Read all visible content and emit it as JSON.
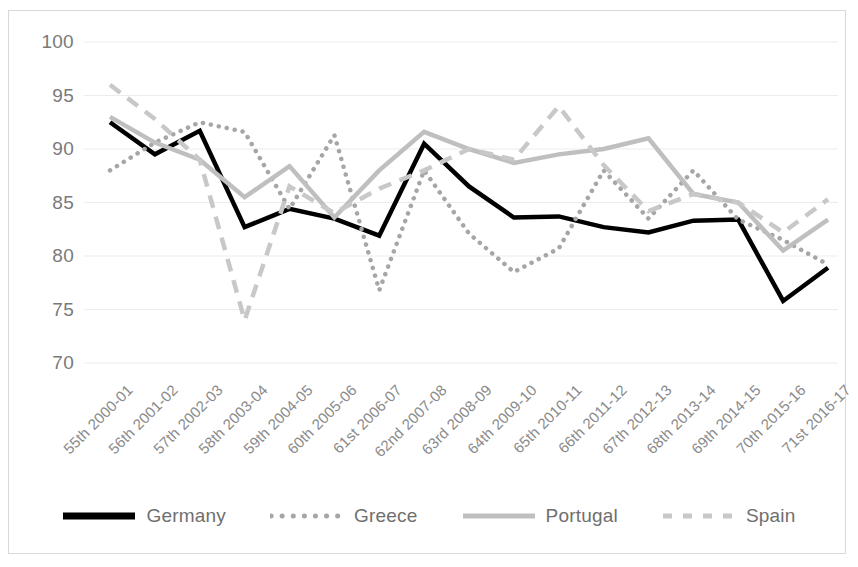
{
  "chart_data": {
    "type": "line",
    "title": "",
    "xlabel": "",
    "ylabel": "",
    "ylim": [
      70,
      100
    ],
    "yticks": [
      70,
      75,
      80,
      85,
      90,
      95,
      100
    ],
    "grid": true,
    "legend_position": "bottom",
    "categories": [
      "55th 2000-01",
      "56th 2001-02",
      "57th 2002-03",
      "58th 2003-04",
      "59th 2004-05",
      "60th 2005-06",
      "61st 2006-07",
      "62nd 2007-08",
      "63rd 2008-09",
      "64th 2009-10",
      "65th 2010-11",
      "66th 2011-12",
      "67th 2012-13",
      "68th 2013-14",
      "69th 2014-15",
      "70th 2015-16",
      "71st 2016-17"
    ],
    "series": [
      {
        "name": "Germany",
        "color": "#000000",
        "style": "solid",
        "width": 4.5,
        "values": [
          92.5,
          89.5,
          91.7,
          82.7,
          84.4,
          83.5,
          81.9,
          90.5,
          86.5,
          83.6,
          83.7,
          82.7,
          82.2,
          83.3,
          83.4,
          75.8,
          78.9
        ]
      },
      {
        "name": "Greece",
        "color": "#a6a6a6",
        "style": "dotted",
        "width": 4.5,
        "values": [
          88.0,
          90.6,
          92.5,
          91.6,
          84.4,
          91.3,
          76.8,
          88.0,
          82.1,
          78.5,
          80.7,
          88.0,
          83.5,
          88.0,
          83.4,
          81.5,
          79.2
        ]
      },
      {
        "name": "Portugal",
        "color": "#bfbfbf",
        "style": "solid",
        "width": 4.5,
        "values": [
          93.0,
          90.6,
          89.0,
          85.5,
          88.4,
          83.6,
          88.0,
          91.6,
          90.0,
          88.7,
          89.5,
          90.0,
          91.0,
          85.8,
          85.0,
          80.5,
          83.4
        ]
      },
      {
        "name": "Spain",
        "color": "#c8c8c8",
        "style": "dashed",
        "width": 4.5,
        "values": [
          96.0,
          92.8,
          89.0,
          74.0,
          86.5,
          84.0,
          86.3,
          88.0,
          90.0,
          89.0,
          94.0,
          88.5,
          84.2,
          85.8,
          85.0,
          82.2,
          85.3
        ]
      }
    ]
  },
  "legend": {
    "items": [
      {
        "label": "Germany",
        "swatch": "swatch-solid-black"
      },
      {
        "label": "Greece",
        "swatch": "swatch-dotted-gray"
      },
      {
        "label": "Portugal",
        "swatch": "swatch-solid-gray"
      },
      {
        "label": "Spain",
        "swatch": "swatch-dashed-gray"
      }
    ]
  },
  "axes": {
    "y_tick_labels": [
      "100",
      "95",
      "90",
      "85",
      "80",
      "75",
      "70"
    ]
  }
}
